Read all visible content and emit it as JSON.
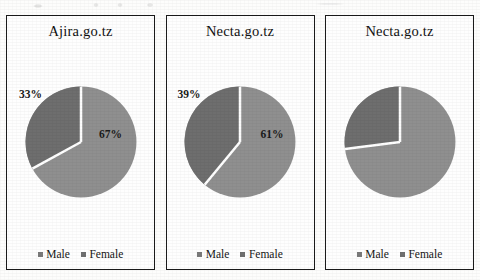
{
  "figure": {
    "background_color": "#fdfdfc",
    "panel_border_color": "#1a1a1a"
  },
  "legend_labels": {
    "male": "Male",
    "female": "Female"
  },
  "colors": {
    "male_slice": "#6e6e6e",
    "female_slice": "#8f8f8f",
    "divider": "#ffffff",
    "label_text": "#1b1b1b"
  },
  "chart_data": [
    {
      "type": "pie",
      "title": "Ajira.go.tz",
      "categories": [
        "Male",
        "Female"
      ],
      "values": [
        33,
        67
      ],
      "labels": [
        "33%",
        "67%"
      ],
      "show_labels": true,
      "legend_position": "bottom"
    },
    {
      "type": "pie",
      "title": "Necta.go.tz",
      "categories": [
        "Male",
        "Female"
      ],
      "values": [
        39,
        61
      ],
      "labels": [
        "39%",
        "61%"
      ],
      "show_labels": true,
      "legend_position": "bottom"
    },
    {
      "type": "pie",
      "title": "Necta.go.tz",
      "categories": [
        "Male",
        "Female"
      ],
      "values": [
        27,
        73
      ],
      "labels": [
        "",
        ""
      ],
      "show_labels": false,
      "legend_position": "bottom"
    }
  ]
}
